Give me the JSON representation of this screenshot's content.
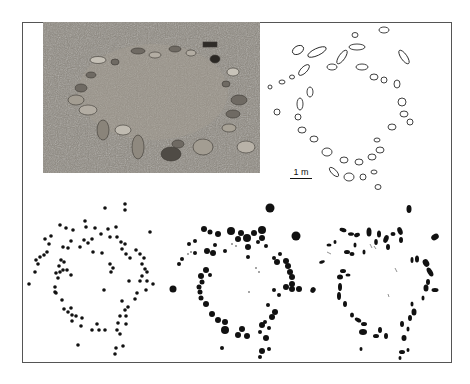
{
  "figure": {
    "panels": [
      {
        "id": "photo",
        "description": "photograph of stone circle on grassy ground"
      },
      {
        "id": "outline-plan",
        "description": "outline drawing of individual stones"
      },
      {
        "id": "point-map",
        "description": "stones as uniform points"
      },
      {
        "id": "size-circle-map",
        "description": "stones as circles scaled by size"
      },
      {
        "id": "shape-map",
        "description": "stones as filled shapes"
      }
    ],
    "scale_bar": {
      "label": "1 m"
    }
  },
  "colors": {
    "ink": "#111111",
    "frame": "#555555",
    "photo_ground": "#8a857d"
  }
}
